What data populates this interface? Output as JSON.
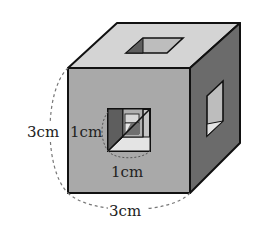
{
  "figure": {
    "type": "cube-with-square-holes",
    "labels": {
      "cube_height": "3cm",
      "cube_width": "3cm",
      "hole_height": "1cm",
      "hole_width": "1cm"
    },
    "colors": {
      "top_face": "#d4d4d4",
      "front_face": "#a9a9a9",
      "right_face": "#6b6b6b",
      "hole_dark": "#5e5e5e",
      "hole_light": "#e4e4e4",
      "hole_mid": "#bdbdbd",
      "edge": "#111111",
      "dash": "#777777"
    }
  }
}
